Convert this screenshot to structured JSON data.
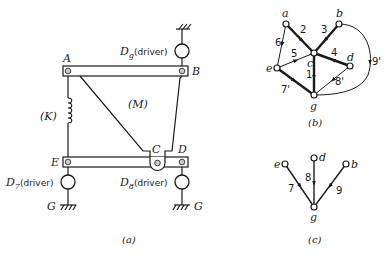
{
  "figure_a": {
    "caption": "(a)",
    "labels": {
      "A": "A",
      "B": "B",
      "C": "C",
      "D": "D",
      "E": "E",
      "M": "(M)",
      "K": "(K)",
      "G_left": "G",
      "G_right": "G"
    },
    "drivers": {
      "top": {
        "symbol": "D",
        "sub": "g",
        "text": "(driver)"
      },
      "left": {
        "symbol": "D",
        "sub": "7",
        "text": "(driver)"
      },
      "right": {
        "symbol": "D",
        "sub": "8",
        "text": "(driver)"
      }
    }
  },
  "figure_b": {
    "caption": "(b)",
    "nodes": [
      "a",
      "b",
      "c",
      "d",
      "e",
      "g"
    ],
    "edges": [
      {
        "label": "1",
        "from": "c",
        "to": "g"
      },
      {
        "label": "2",
        "from": "a",
        "to": "c"
      },
      {
        "label": "3",
        "from": "b",
        "to": "c"
      },
      {
        "label": "4",
        "from": "d",
        "to": "c"
      },
      {
        "label": "5",
        "from": "e",
        "to": "c"
      },
      {
        "label": "6",
        "from": "a",
        "to": "e"
      },
      {
        "label": "7'",
        "from": "e",
        "to": "g"
      },
      {
        "label": "8'",
        "from": "d",
        "to": "g"
      },
      {
        "label": "9'",
        "from": "b",
        "to": "g"
      }
    ]
  },
  "figure_c": {
    "caption": "(c)",
    "nodes": [
      "e",
      "d",
      "b",
      "g"
    ],
    "edges": [
      {
        "label": "7",
        "from": "e",
        "to": "g"
      },
      {
        "label": "8",
        "from": "d",
        "to": "g"
      },
      {
        "label": "9",
        "from": "b",
        "to": "g"
      }
    ]
  }
}
